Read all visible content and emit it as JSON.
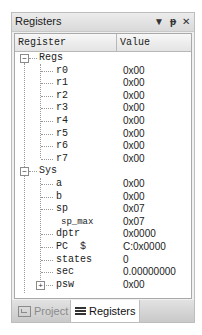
{
  "panel": {
    "title": "Registers",
    "controls": {
      "dropdown": "▼",
      "pin": "ᚦ",
      "close": "✕"
    }
  },
  "grid": {
    "columns": [
      "Register",
      "Value"
    ],
    "groups": [
      {
        "name": "Regs",
        "expander": "−",
        "items": [
          {
            "name": "r0",
            "value": "0x00"
          },
          {
            "name": "r1",
            "value": "0x00"
          },
          {
            "name": "r2",
            "value": "0x00"
          },
          {
            "name": "r3",
            "value": "0x00"
          },
          {
            "name": "r4",
            "value": "0x00"
          },
          {
            "name": "r5",
            "value": "0x00"
          },
          {
            "name": "r6",
            "value": "0x00"
          },
          {
            "name": "r7",
            "value": "0x00"
          }
        ]
      },
      {
        "name": "Sys",
        "expander": "−",
        "items": [
          {
            "name": "a",
            "value": "0x00"
          },
          {
            "name": "b",
            "value": "0x00"
          },
          {
            "name": "sp",
            "value": "0x07"
          },
          {
            "name": "sp_max",
            "value": "0x07"
          },
          {
            "name": "dptr",
            "value": "0x0000"
          },
          {
            "name": "PC  $",
            "value": "C:0x0000"
          },
          {
            "name": "states",
            "value": "0"
          },
          {
            "name": "sec",
            "value": "0.00000000"
          },
          {
            "name": "psw",
            "value": "0x00",
            "expander": "+"
          }
        ]
      }
    ]
  },
  "tabs": [
    {
      "label": "Project",
      "icon": "project-icon",
      "active": false
    },
    {
      "label": "Registers",
      "icon": "registers-icon",
      "active": true
    }
  ]
}
